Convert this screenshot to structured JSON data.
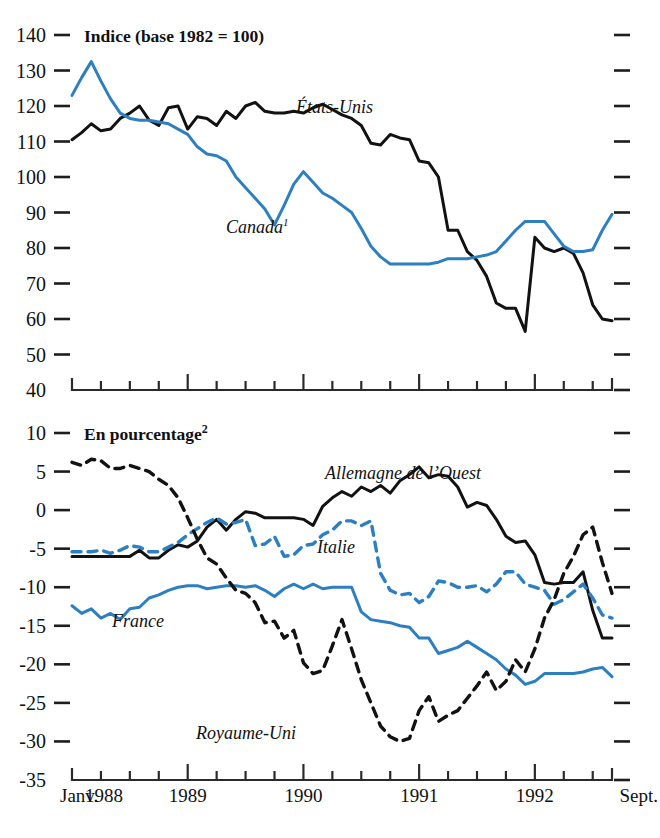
{
  "figure": {
    "background": "#ffffff",
    "colors": {
      "black": "#121212",
      "blue": "#2d7fc0",
      "axis": "#2a2a2a"
    }
  },
  "panels": [
    {
      "id": "top",
      "title": "Indice (base 1982 = 100)",
      "title_sup": "",
      "y_axis": {
        "ticks": [
          140,
          130,
          120,
          110,
          100,
          90,
          80,
          70,
          60,
          50,
          40
        ],
        "min": 40,
        "max": 140
      },
      "labels": [
        {
          "name": "etats-unis",
          "text": "États-Unis",
          "sup": "",
          "x": 296,
          "y": 113
        },
        {
          "name": "canada",
          "text": "Canada",
          "sup": "1",
          "x": 226,
          "y": 233
        }
      ]
    },
    {
      "id": "bottom",
      "title": "En pourcentage",
      "title_sup": "2",
      "y_axis": {
        "ticks": [
          10,
          5,
          0,
          -5,
          -10,
          -15,
          -20,
          -25,
          -30,
          -35
        ],
        "min": -35,
        "max": 10
      },
      "labels": [
        {
          "name": "allemagne-de-l-ouest",
          "text": "Allemagne de l’Ouest",
          "sup": "",
          "x": 325,
          "y": 479
        },
        {
          "name": "italie",
          "text": "Italie",
          "sup": "",
          "x": 317,
          "y": 553
        },
        {
          "name": "france",
          "text": "France",
          "sup": "",
          "x": 112,
          "y": 627
        },
        {
          "name": "royaume-uni",
          "text": "Royaume-Uni",
          "sup": "",
          "x": 196,
          "y": 739
        }
      ]
    }
  ],
  "x_axis": {
    "start_label": "Janv.",
    "end_label": "Sept.",
    "year_labels": [
      "1988",
      "1989",
      "1990",
      "1991",
      "1992"
    ],
    "min_month": 0,
    "max_month": 56,
    "tick_interval_months": 3,
    "major_tick_interval_months": 12
  },
  "chart_data": [
    {
      "type": "line",
      "panel": "top",
      "title": "Indice (base 1982 = 100)",
      "xlabel": "",
      "ylabel": "Indice (base 1982 = 100)",
      "ylim": [
        40,
        140
      ],
      "xlim": [
        0,
        56
      ],
      "grid": false,
      "legend": "in-plot labels",
      "x": [
        0,
        1,
        2,
        3,
        4,
        5,
        6,
        7,
        8,
        9,
        10,
        11,
        12,
        13,
        14,
        15,
        16,
        17,
        18,
        19,
        20,
        21,
        22,
        23,
        24,
        25,
        26,
        27,
        28,
        29,
        30,
        31,
        32,
        33,
        34,
        35,
        36,
        37,
        38,
        39,
        40,
        41,
        42,
        43,
        44,
        45,
        46,
        47,
        48,
        49,
        50,
        51,
        52,
        53,
        54,
        55,
        56
      ],
      "series": [
        {
          "name": "États-Unis",
          "style": "solid",
          "color": "#121212",
          "values": [
            110.5,
            112.5,
            115,
            113,
            113.5,
            116.5,
            118,
            120,
            116,
            114.5,
            119.5,
            120,
            113.5,
            117,
            116.5,
            114.5,
            118.5,
            116.5,
            120,
            121,
            118.5,
            118,
            118,
            118.5,
            118,
            119.5,
            120.5,
            119,
            117.5,
            116.5,
            114.5,
            109.5,
            109,
            112,
            111,
            110.5,
            104.5,
            104,
            100,
            85,
            85,
            79,
            76.5,
            72,
            64.5,
            63,
            63,
            56.5,
            83,
            80,
            79,
            80,
            78.5,
            73,
            64,
            60,
            59.5
          ]
        },
        {
          "name": "Canada",
          "style": "solid",
          "color": "#2d7fc0",
          "values": [
            123,
            128,
            132.5,
            127,
            122,
            118,
            116.5,
            116,
            116,
            115.5,
            115,
            113.5,
            112,
            108.5,
            106.5,
            106,
            104.5,
            100,
            97,
            94,
            91,
            86.5,
            92,
            98,
            101.5,
            98.5,
            95.5,
            94,
            92,
            90,
            85.5,
            80.5,
            77.5,
            75.5,
            75.5,
            75.5,
            75.5,
            75.5,
            76,
            77,
            77,
            77,
            77.5,
            78,
            79,
            82,
            85,
            87.5,
            87.5,
            87.5,
            84,
            80.5,
            79,
            79,
            79.5,
            85,
            89.5
          ]
        }
      ]
    },
    {
      "type": "line",
      "panel": "bottom",
      "title": "En pourcentage",
      "xlabel": "",
      "ylabel": "En pourcentage",
      "ylim": [
        -35,
        10
      ],
      "xlim": [
        0,
        56
      ],
      "grid": false,
      "legend": "in-plot labels",
      "x": [
        0,
        1,
        2,
        3,
        4,
        5,
        6,
        7,
        8,
        9,
        10,
        11,
        12,
        13,
        14,
        15,
        16,
        17,
        18,
        19,
        20,
        21,
        22,
        23,
        24,
        25,
        26,
        27,
        28,
        29,
        30,
        31,
        32,
        33,
        34,
        35,
        36,
        37,
        38,
        39,
        40,
        41,
        42,
        43,
        44,
        45,
        46,
        47,
        48,
        49,
        50,
        51,
        52,
        53,
        54,
        55,
        56
      ],
      "series": [
        {
          "name": "Allemagne de l’Ouest",
          "style": "solid",
          "color": "#121212",
          "values": [
            -6,
            -6,
            -6,
            -6,
            -6,
            -6,
            -6,
            -5.2,
            -6.2,
            -6.2,
            -5.2,
            -4.5,
            -4.8,
            -4,
            -2.2,
            -1.2,
            -2.6,
            -1.2,
            -0.2,
            -0.4,
            -1,
            -1,
            -1,
            -1,
            -1.2,
            -2,
            0.5,
            1.6,
            2.4,
            1.8,
            3,
            2.4,
            3.2,
            2.2,
            3.8,
            4.6,
            5.6,
            4.2,
            4.6,
            4.4,
            3,
            0.4,
            1,
            0.6,
            -1.2,
            -3.4,
            -4.2,
            -4,
            -5.8,
            -9.4,
            -9.6,
            -9.4,
            -9.4,
            -8,
            -13,
            -16.6,
            -16.6
          ]
        },
        {
          "name": "Italie",
          "style": "dashed",
          "color": "#2d7fc0",
          "values": [
            -5.4,
            -5.4,
            -5.4,
            -5.2,
            -5.6,
            -5.2,
            -4.6,
            -4.8,
            -5.4,
            -5.4,
            -4.8,
            -4.2,
            -3.2,
            -2.4,
            -1.6,
            -1,
            -1.8,
            -1.6,
            -1.2,
            -4.6,
            -4.4,
            -3.4,
            -6,
            -5.8,
            -4.6,
            -4.4,
            -3.2,
            -2.6,
            -1.4,
            -1.4,
            -2,
            -1.4,
            -8.2,
            -10.4,
            -11,
            -10.8,
            -12,
            -11.2,
            -9.2,
            -9.4,
            -10,
            -10,
            -9.8,
            -10.6,
            -9.6,
            -8,
            -8,
            -9.6,
            -10,
            -10.4,
            -12.2,
            -11.6,
            -10.6,
            -9.6,
            -11.4,
            -13.6,
            -14
          ]
        },
        {
          "name": "France",
          "style": "solid",
          "color": "#2d7fc0",
          "values": [
            -12.4,
            -13.4,
            -12.8,
            -14,
            -13.4,
            -14.2,
            -12.8,
            -12.6,
            -11.4,
            -11,
            -10.4,
            -10,
            -9.8,
            -9.8,
            -10.2,
            -10,
            -9.8,
            -9.8,
            -10,
            -9.8,
            -10.4,
            -11.2,
            -10.2,
            -9.6,
            -10.2,
            -9.6,
            -10.2,
            -10,
            -10,
            -10,
            -13.2,
            -14.2,
            -14.4,
            -14.6,
            -15,
            -15.2,
            -16.6,
            -16.6,
            -18.6,
            -18.2,
            -17.8,
            -17,
            -17.8,
            -18.6,
            -19.4,
            -20.6,
            -21.4,
            -22.6,
            -22.2,
            -21.2,
            -21.2,
            -21.2,
            -21.2,
            -21,
            -20.6,
            -20.4,
            -21.6
          ]
        },
        {
          "name": "Royaume-Uni",
          "style": "dashed",
          "color": "#121212",
          "values": [
            6.2,
            5.8,
            6.6,
            6.4,
            5.4,
            5.4,
            5.8,
            5.4,
            5,
            4,
            3.2,
            1.6,
            -1,
            -3.8,
            -6.2,
            -7,
            -8.8,
            -10.4,
            -10.8,
            -12,
            -14.6,
            -14.4,
            -16.6,
            -15.6,
            -19.8,
            -21.2,
            -20.8,
            -17.6,
            -14.2,
            -18,
            -22,
            -25,
            -28,
            -29.4,
            -30,
            -29.6,
            -26,
            -24.2,
            -27.4,
            -26.6,
            -26,
            -24.4,
            -22.8,
            -21,
            -23.4,
            -22.2,
            -19.4,
            -21,
            -18,
            -14,
            -11.6,
            -8.2,
            -6,
            -3.2,
            -2.2,
            -6.8,
            -10.8
          ]
        }
      ]
    }
  ]
}
